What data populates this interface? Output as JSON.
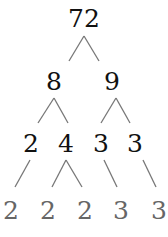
{
  "diagram": {
    "type": "factor-tree",
    "root": "72",
    "level1": [
      "8",
      "9"
    ],
    "level2": [
      "2",
      "4",
      "3",
      "3"
    ],
    "level3": [
      "2",
      "2",
      "2",
      "3",
      "3"
    ]
  }
}
